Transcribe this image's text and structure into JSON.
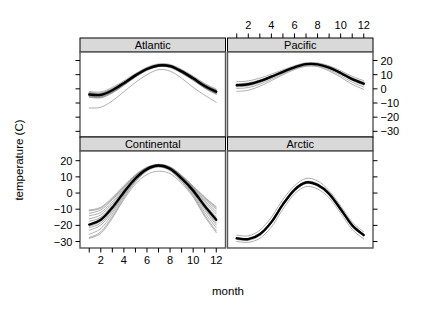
{
  "figure": {
    "type": "trellis-line-panels",
    "width": 432,
    "height": 310,
    "background": "#ffffff",
    "strip_fill": "#d9d9d9",
    "strip_border": "#000000",
    "panel_border": "#555555",
    "mean_line_color": "#000000",
    "series_line_color": "#666666"
  },
  "axes": {
    "x_title": "month",
    "y_title": "temperature (C)",
    "x_ticks": [
      2,
      4,
      6,
      8,
      10,
      12
    ],
    "x_tick_labels": [
      "2",
      "4",
      "6",
      "8",
      "10",
      "12"
    ],
    "y_ticks": [
      20,
      10,
      0,
      -10,
      -20,
      -30
    ],
    "y_tick_labels": [
      "20",
      "10",
      "0",
      "-10",
      "-20",
      "-30"
    ],
    "xlim": [
      0.2,
      12.8
    ],
    "ylim": [
      -34,
      26
    ],
    "x_axis_positions": [
      "bottom-left-panel",
      "top-right-panel"
    ],
    "y_axis_positions": [
      "left-bottom-panel",
      "right-top-panel"
    ]
  },
  "panels": [
    {
      "name": "Atlantic",
      "row": 0,
      "col": 0
    },
    {
      "name": "Pacific",
      "row": 0,
      "col": 1
    },
    {
      "name": "Continental",
      "row": 1,
      "col": 0
    },
    {
      "name": "Arctic",
      "row": 1,
      "col": 1
    }
  ],
  "chart_data": {
    "type": "line",
    "title": "",
    "subtitle": "",
    "xlabel": "month",
    "ylabel": "temperature (C)",
    "xlim": [
      0.2,
      12.8
    ],
    "ylim": [
      -34,
      26
    ],
    "grid": false,
    "legend": "none",
    "x": [
      1,
      2,
      3,
      4,
      5,
      6,
      7,
      8,
      9,
      10,
      11,
      12
    ],
    "xtick_labels": [
      "2",
      "4",
      "6",
      "8",
      "10",
      "12"
    ],
    "ytick_labels": [
      "20",
      "10",
      "0",
      "-10",
      "-20",
      "-30"
    ],
    "facets": [
      {
        "name": "Atlantic",
        "mean": {
          "name": "Atlantic mean",
          "emphasis": true,
          "values": [
            -4.0,
            -4.3,
            -1.0,
            4.0,
            9.5,
            14.0,
            16.5,
            16.0,
            12.3,
            7.4,
            2.0,
            -2.0
          ]
        },
        "series": [
          {
            "name": "station 1",
            "values": [
              -2.5,
              -3.0,
              0.2,
              5.0,
              10.3,
              14.8,
              17.2,
              16.8,
              13.2,
              8.4,
              3.2,
              -0.8
            ]
          },
          {
            "name": "station 2",
            "values": [
              -3.2,
              -3.6,
              -0.4,
              4.4,
              9.9,
              14.4,
              16.9,
              16.4,
              12.7,
              7.9,
              2.6,
              -1.4
            ]
          },
          {
            "name": "station 3",
            "values": [
              -4.4,
              -4.8,
              -1.5,
              3.6,
              9.2,
              13.8,
              16.3,
              15.8,
              12.0,
              7.0,
              1.6,
              -2.5
            ]
          },
          {
            "name": "station 4",
            "values": [
              -5.2,
              -5.6,
              -2.2,
              3.0,
              8.7,
              13.4,
              16.0,
              15.4,
              11.5,
              6.5,
              1.0,
              -3.2
            ]
          },
          {
            "name": "station 5",
            "values": [
              -1.8,
              -2.2,
              1.0,
              5.6,
              10.8,
              15.2,
              17.6,
              17.2,
              13.7,
              9.0,
              3.8,
              -0.2
            ]
          },
          {
            "name": "station 6",
            "values": [
              -6.0,
              -6.4,
              -3.0,
              2.4,
              8.2,
              13.0,
              15.7,
              15.0,
              11.0,
              5.9,
              0.4,
              -4.0
            ]
          },
          {
            "name": "station 7",
            "values": [
              -3.8,
              -4.1,
              -0.8,
              4.2,
              9.7,
              14.2,
              16.7,
              16.2,
              12.5,
              7.7,
              2.3,
              -1.8
            ]
          },
          {
            "name": "station 8",
            "values": [
              -4.9,
              -5.2,
              -1.9,
              3.3,
              9.0,
              13.6,
              16.1,
              15.6,
              11.8,
              6.8,
              1.3,
              -2.9
            ]
          },
          {
            "name": "station 9",
            "values": [
              -2.9,
              -3.3,
              -0.1,
              4.7,
              10.1,
              14.6,
              17.0,
              16.6,
              13.0,
              8.2,
              2.9,
              -1.0
            ]
          },
          {
            "name": "station 10",
            "values": [
              -13.5,
              -13.0,
              -8.5,
              -2.0,
              4.5,
              10.0,
              13.5,
              12.5,
              7.5,
              1.0,
              -4.5,
              -9.5
            ]
          },
          {
            "name": "station 11",
            "values": [
              -3.5,
              -3.9,
              -0.6,
              4.3,
              9.8,
              14.3,
              16.8,
              16.3,
              12.6,
              7.8,
              2.5,
              -1.6
            ]
          },
          {
            "name": "station 12",
            "values": [
              -5.6,
              -6.0,
              -2.6,
              2.7,
              8.4,
              13.2,
              15.8,
              15.2,
              11.2,
              6.2,
              0.7,
              -3.6
            ]
          }
        ]
      },
      {
        "name": "Pacific",
        "mean": {
          "name": "Pacific mean",
          "emphasis": true,
          "values": [
            2.5,
            3.2,
            5.4,
            8.6,
            12.0,
            15.2,
            17.4,
            17.3,
            15.0,
            11.2,
            6.8,
            3.6
          ]
        },
        "series": [
          {
            "name": "station 1",
            "values": [
              5.0,
              5.6,
              7.6,
              10.4,
              13.4,
              16.3,
              18.4,
              18.3,
              16.3,
              12.8,
              8.8,
              5.8
            ]
          },
          {
            "name": "station 2",
            "values": [
              3.6,
              4.2,
              6.3,
              9.3,
              12.6,
              15.7,
              17.9,
              17.8,
              15.6,
              12.0,
              7.8,
              4.7
            ]
          },
          {
            "name": "station 3",
            "values": [
              1.4,
              2.1,
              4.4,
              7.8,
              11.4,
              14.7,
              16.9,
              16.8,
              14.3,
              10.4,
              5.9,
              2.6
            ]
          },
          {
            "name": "station 4",
            "values": [
              0.2,
              0.9,
              3.3,
              6.9,
              10.7,
              14.1,
              16.4,
              16.2,
              13.5,
              9.4,
              4.7,
              1.3
            ]
          },
          {
            "name": "station 5",
            "values": [
              -1.8,
              -1.0,
              1.8,
              5.8,
              9.9,
              13.6,
              15.9,
              15.6,
              12.6,
              8.2,
              3.2,
              -0.4
            ]
          },
          {
            "name": "station 6",
            "values": [
              3.0,
              3.7,
              5.9,
              9.0,
              12.3,
              15.5,
              17.6,
              17.5,
              15.3,
              11.6,
              7.3,
              4.1
            ]
          },
          {
            "name": "station 7",
            "values": [
              2.0,
              2.7,
              4.9,
              8.2,
              11.7,
              15.0,
              17.1,
              17.0,
              14.6,
              10.8,
              6.3,
              3.1
            ]
          }
        ]
      },
      {
        "name": "Continental",
        "mean": {
          "name": "Continental mean",
          "emphasis": true,
          "values": [
            -19.5,
            -16.5,
            -9.0,
            0.5,
            9.0,
            14.8,
            17.0,
            15.0,
            9.0,
            1.5,
            -8.0,
            -16.5
          ]
        },
        "series": [
          {
            "name": "station 1",
            "values": [
              -10.5,
              -8.8,
              -2.8,
              4.5,
              11.3,
              16.0,
              17.8,
              16.2,
              11.0,
              4.3,
              -2.5,
              -8.5
            ]
          },
          {
            "name": "station 2",
            "values": [
              -12.5,
              -10.5,
              -4.2,
              3.4,
              10.6,
              15.6,
              17.5,
              15.8,
              10.4,
              3.4,
              -3.8,
              -10.0
            ]
          },
          {
            "name": "station 3",
            "values": [
              -16.0,
              -13.5,
              -6.5,
              2.0,
              9.8,
              15.1,
              17.2,
              15.4,
              9.7,
              2.5,
              -5.6,
              -13.0
            ]
          },
          {
            "name": "station 4",
            "values": [
              -20.5,
              -17.5,
              -9.8,
              0.0,
              8.6,
              14.6,
              16.8,
              14.8,
              8.7,
              1.0,
              -8.6,
              -17.5
            ]
          },
          {
            "name": "station 5",
            "values": [
              -23.0,
              -19.8,
              -11.6,
              -1.2,
              7.8,
              14.2,
              16.5,
              14.4,
              8.0,
              0.0,
              -10.4,
              -19.8
            ]
          },
          {
            "name": "station 6",
            "values": [
              -27.5,
              -24.0,
              -14.5,
              -3.0,
              6.8,
              13.6,
              16.1,
              13.8,
              7.0,
              -1.6,
              -13.5,
              -23.5
            ]
          },
          {
            "name": "station 7",
            "values": [
              -25.5,
              -22.0,
              -13.0,
              -2.0,
              7.3,
              13.9,
              16.3,
              14.1,
              7.5,
              -0.8,
              -12.0,
              -21.5
            ]
          },
          {
            "name": "station 8",
            "values": [
              -17.5,
              -15.0,
              -7.6,
              1.2,
              9.3,
              14.9,
              17.0,
              15.1,
              9.2,
              1.9,
              -6.8,
              -14.8
            ]
          },
          {
            "name": "station 9",
            "values": [
              -14.0,
              -12.0,
              -5.4,
              2.7,
              10.2,
              15.3,
              17.3,
              15.6,
              10.0,
              3.0,
              -4.7,
              -11.5
            ]
          },
          {
            "name": "station 10",
            "values": [
              -21.5,
              -18.5,
              -10.6,
              -0.6,
              8.2,
              14.4,
              16.6,
              14.6,
              8.4,
              0.5,
              -9.5,
              -18.6
            ]
          },
          {
            "name": "station 11",
            "values": [
              -28.0,
              -25.0,
              -15.5,
              -4.0,
              5.5,
              11.5,
              13.5,
              12.0,
              6.0,
              -2.5,
              -14.5,
              -24.5
            ]
          },
          {
            "name": "station 12",
            "values": [
              -11.0,
              -9.5,
              -3.5,
              3.9,
              10.9,
              15.8,
              17.6,
              16.0,
              10.7,
              3.8,
              -3.0,
              -9.2
            ]
          }
        ]
      },
      {
        "name": "Arctic",
        "mean": {
          "name": "Arctic mean",
          "emphasis": true,
          "values": [
            -28.0,
            -28.5,
            -25.5,
            -18.0,
            -7.0,
            2.0,
            6.5,
            5.0,
            -0.5,
            -10.0,
            -20.0,
            -26.0
          ]
        },
        "series": [
          {
            "name": "station 1",
            "values": [
              -26.0,
              -26.5,
              -23.0,
              -15.0,
              -4.0,
              4.5,
              9.0,
              7.5,
              1.5,
              -8.0,
              -18.0,
              -24.0
            ]
          },
          {
            "name": "station 2",
            "values": [
              -30.0,
              -30.5,
              -28.0,
              -21.0,
              -10.0,
              -0.5,
              4.0,
              2.5,
              -3.0,
              -12.5,
              -22.5,
              -28.5
            ]
          },
          {
            "name": "station 3",
            "values": [
              -27.5,
              -28.0,
              -24.8,
              -17.2,
              -6.2,
              2.8,
              7.2,
              5.8,
              0.2,
              -9.2,
              -19.2,
              -25.5
            ]
          },
          {
            "name": "station 4",
            "values": [
              -28.8,
              -29.3,
              -26.3,
              -18.8,
              -7.8,
              1.2,
              5.8,
              4.2,
              -1.3,
              -10.8,
              -20.8,
              -26.8
            ]
          }
        ]
      }
    ]
  }
}
